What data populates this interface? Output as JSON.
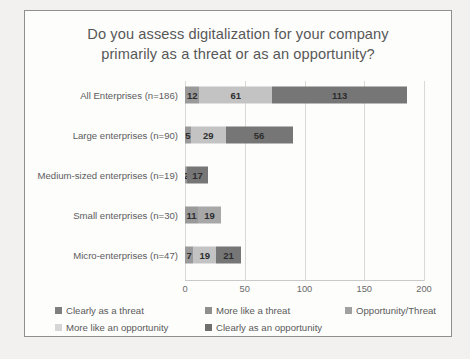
{
  "chart_data": {
    "type": "bar",
    "orientation": "horizontal",
    "stacked": true,
    "title": "Do you assess digitalization for your company primarily as a threat or as an opportunity?",
    "title_lines": [
      "Do you assess digitalization for your company",
      "primarily as a threat or as an opportunity?"
    ],
    "xlabel": "",
    "ylabel": "",
    "xlim": [
      0,
      200
    ],
    "xticks": [
      0,
      50,
      100,
      150,
      200
    ],
    "xtick_labels": [
      "0",
      "50",
      "100",
      "150",
      "200"
    ],
    "grid": true,
    "legend_position": "bottom",
    "categories": [
      "All Enterprises (n=186)",
      "Large enterprises (n=90)",
      "Medium-sized enterprises (n=19)",
      "Small enterprises (n=30)",
      "Micro-enterprises (n=47)"
    ],
    "series": [
      {
        "name": "Clearly as a threat",
        "color": "#7f7f7f",
        "values": [
          0,
          0,
          0,
          0,
          0
        ]
      },
      {
        "name": "More like a threat",
        "color": "#9a9a9a",
        "values": [
          12,
          5,
          2,
          11,
          7
        ]
      },
      {
        "name": "Opportunity/Threat",
        "color": "#c3c3c3",
        "values": [
          61,
          29,
          17,
          19,
          19
        ]
      },
      {
        "name": "More like an opportunity",
        "color": "#dadada",
        "values": [
          0,
          0,
          0,
          0,
          0
        ]
      },
      {
        "name": "Clearly as an opportunity",
        "color": "#767676",
        "values": [
          113,
          56,
          0,
          0,
          21
        ]
      }
    ],
    "bars": [
      {
        "category": "All Enterprises (n=186)",
        "total": 186,
        "segments": [
          {
            "label": "12",
            "value": 12,
            "color": "#9a9a9a"
          },
          {
            "label": "61",
            "value": 61,
            "color": "#c3c3c3"
          },
          {
            "label": "113",
            "value": 113,
            "color": "#767676"
          }
        ]
      },
      {
        "category": "Large enterprises (n=90)",
        "total": 90,
        "segments": [
          {
            "label": "5",
            "value": 5,
            "color": "#9a9a9a"
          },
          {
            "label": "29",
            "value": 29,
            "color": "#c3c3c3"
          },
          {
            "label": "56",
            "value": 56,
            "color": "#767676"
          }
        ]
      },
      {
        "category": "Medium-sized enterprises (n=19)",
        "total": 19,
        "segments": [
          {
            "label": "2",
            "value": 2,
            "color": "#9a9a9a"
          },
          {
            "label": "17",
            "value": 17,
            "color": "#767676"
          }
        ]
      },
      {
        "category": "Small enterprises (n=30)",
        "total": 30,
        "segments": [
          {
            "label": "11",
            "value": 11,
            "color": "#9a9a9a"
          },
          {
            "label": "19",
            "value": 19,
            "color": "#a8a8a8"
          }
        ]
      },
      {
        "category": "Micro-enterprises (n=47)",
        "total": 47,
        "segments": [
          {
            "label": "7",
            "value": 7,
            "color": "#9a9a9a"
          },
          {
            "label": "19",
            "value": 19,
            "color": "#c3c3c3"
          },
          {
            "label": "21",
            "value": 21,
            "color": "#767676"
          }
        ]
      }
    ],
    "legend": [
      {
        "label": "Clearly as a threat",
        "color": "#7f7f7f"
      },
      {
        "label": "More like a threat",
        "color": "#8f8f8f"
      },
      {
        "label": "Opportunity/Threat",
        "color": "#a0a0a0"
      },
      {
        "label": "More like an opportunity",
        "color": "#d6d6d6"
      },
      {
        "label": "Clearly as an opportunity",
        "color": "#6f6f6f"
      }
    ]
  }
}
